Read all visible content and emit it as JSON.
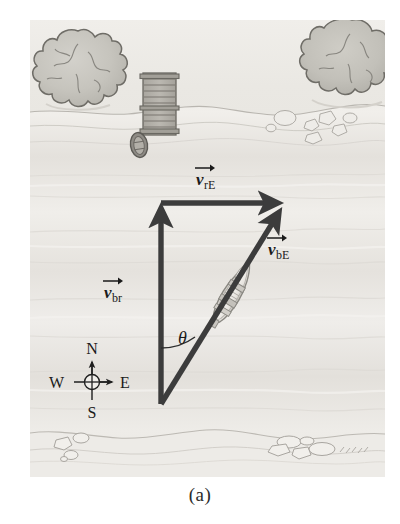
{
  "figure": {
    "caption": "(a)",
    "frame": {
      "x": 30,
      "y": 20,
      "width": 355,
      "height": 457
    }
  },
  "colors": {
    "page_background": "#ffffff",
    "water": "#e8e6e1",
    "water_band_light": "#f2f0ec",
    "water_band_dark": "#dcd9d3",
    "bank": "#eceae5",
    "tree_fill": "#c9c7c0",
    "tree_outline": "#6f6d67",
    "dock_fill": "#b9b6af",
    "dock_outline": "#6a6862",
    "rock_outline": "#9a9892",
    "vector_color": "#3c3c3c",
    "boat_hull": "#f4f2ee",
    "boat_outline": "#8a8882",
    "text": "#1a1a1a"
  },
  "vectors": [
    {
      "id": "v-br",
      "label_main": "v",
      "label_sub": "br",
      "label_x": 104,
      "label_y": 298,
      "description": "velocity of boat relative to river",
      "x1": 161,
      "y1": 404,
      "x2": 161,
      "y2": 203
    },
    {
      "id": "v-rE",
      "label_main": "v",
      "label_sub": "rE",
      "label_x": 196,
      "label_y": 185,
      "description": "velocity of river relative to Earth",
      "x1": 161,
      "y1": 203,
      "x2": 283,
      "y2": 203
    },
    {
      "id": "v-bE",
      "label_main": "v",
      "label_sub": "bE",
      "label_x": 268,
      "label_y": 255,
      "description": "velocity of boat relative to Earth",
      "x1": 161,
      "y1": 404,
      "x2": 283,
      "y2": 205
    }
  ],
  "angle": {
    "symbol": "θ",
    "label_x": 178,
    "label_y": 344,
    "description": "angle between v-br and v-bE"
  },
  "compass": {
    "center_x": 92,
    "center_y": 382,
    "arm": 27,
    "north": "N",
    "east": "E",
    "south": "S",
    "west": "W"
  },
  "scenery": {
    "trees": [
      {
        "id": "tree-left",
        "cx": 78,
        "cy": 73,
        "r": 42
      },
      {
        "id": "tree-right",
        "cx": 352,
        "cy": 62,
        "r": 42
      }
    ],
    "dock": {
      "x": 143,
      "y": 73,
      "width": 33,
      "height": 62
    },
    "moored_boat": {
      "cx": 139,
      "cy": 145,
      "rx": 8,
      "ry": 12
    },
    "boat": {
      "cx": 232,
      "cy": 294,
      "angle_deg": 31
    }
  }
}
